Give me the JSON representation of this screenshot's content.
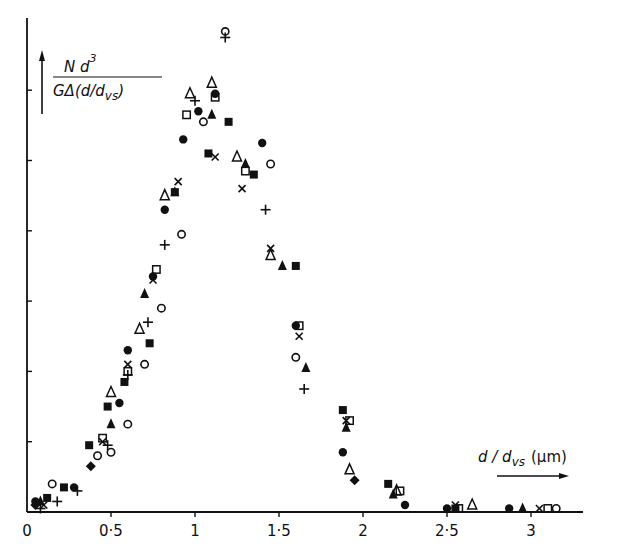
{
  "chart_data": {
    "type": "scatter",
    "title": "",
    "xlabel": "d/d_vs (μm)",
    "ylabel": "N d^3 / G Δ(d/d_vs)",
    "ylabel_parts": {
      "numerator": "N d",
      "numerator_sup": "3",
      "denominator": "GΔ(d/d",
      "denominator_sub": "vs",
      "denominator_end": ")"
    },
    "xlabel_parts": {
      "main": "d / d",
      "sub": "vs",
      "unit": "(μm)"
    },
    "xlim": [
      0,
      3.3
    ],
    "ylim": [
      0,
      7
    ],
    "x_ticks": [
      {
        "value": 0,
        "label": "0"
      },
      {
        "value": 0.5,
        "label": "0·5"
      },
      {
        "value": 1,
        "label": "1"
      },
      {
        "value": 1.5,
        "label": "1·5"
      },
      {
        "value": 2,
        "label": "2"
      },
      {
        "value": 2.5,
        "label": "2·5"
      },
      {
        "value": 3,
        "label": "3"
      }
    ],
    "y_ticks": [
      1,
      2,
      3,
      4,
      5,
      6
    ],
    "y_tick_labels_shown": false,
    "grid": false,
    "legend": null,
    "markers": [
      "filled-circle",
      "open-circle",
      "filled-triangle",
      "open-triangle",
      "filled-square",
      "open-square",
      "cross",
      "plus",
      "filled-diamond"
    ],
    "series": [
      {
        "name": "filled-circle",
        "marker": "filled-circle",
        "points": [
          [
            0.05,
            0.15
          ],
          [
            0.28,
            0.35
          ],
          [
            0.55,
            1.55
          ],
          [
            0.6,
            2.3
          ],
          [
            0.75,
            3.35
          ],
          [
            0.82,
            4.3
          ],
          [
            0.93,
            5.3
          ],
          [
            1.12,
            5.95
          ],
          [
            1.02,
            5.7
          ],
          [
            1.4,
            5.25
          ],
          [
            1.6,
            2.65
          ],
          [
            1.88,
            0.85
          ],
          [
            2.25,
            0.1
          ],
          [
            2.5,
            0.05
          ],
          [
            2.87,
            0.05
          ]
        ]
      },
      {
        "name": "open-circle",
        "marker": "open-circle",
        "points": [
          [
            0.15,
            0.4
          ],
          [
            0.42,
            0.8
          ],
          [
            0.5,
            0.85
          ],
          [
            0.6,
            1.25
          ],
          [
            0.7,
            2.1
          ],
          [
            0.8,
            2.9
          ],
          [
            0.92,
            3.95
          ],
          [
            1.05,
            5.55
          ],
          [
            1.45,
            4.95
          ],
          [
            1.6,
            2.2
          ],
          [
            3.15,
            0.05
          ]
        ]
      },
      {
        "name": "filled-triangle",
        "marker": "filled-triangle",
        "points": [
          [
            0.08,
            0.15
          ],
          [
            0.5,
            1.25
          ],
          [
            0.7,
            3.1
          ],
          [
            0.88,
            4.55
          ],
          [
            1.1,
            5.65
          ],
          [
            1.3,
            4.95
          ],
          [
            1.52,
            3.5
          ],
          [
            1.66,
            2.05
          ],
          [
            1.9,
            1.2
          ],
          [
            2.18,
            0.25
          ],
          [
            2.95,
            0.05
          ]
        ]
      },
      {
        "name": "open-triangle",
        "marker": "open-triangle",
        "points": [
          [
            0.5,
            1.7
          ],
          [
            0.67,
            2.6
          ],
          [
            0.82,
            4.5
          ],
          [
            0.97,
            5.95
          ],
          [
            1.1,
            6.1
          ],
          [
            1.25,
            5.05
          ],
          [
            1.45,
            3.65
          ],
          [
            1.92,
            0.6
          ],
          [
            2.2,
            0.3
          ],
          [
            2.65,
            0.1
          ]
        ]
      },
      {
        "name": "filled-square",
        "marker": "filled-square",
        "points": [
          [
            0.12,
            0.2
          ],
          [
            0.22,
            0.35
          ],
          [
            0.37,
            0.95
          ],
          [
            0.48,
            1.5
          ],
          [
            0.58,
            1.85
          ],
          [
            0.73,
            2.4
          ],
          [
            0.88,
            4.55
          ],
          [
            1.08,
            5.1
          ],
          [
            1.2,
            5.55
          ],
          [
            1.35,
            4.8
          ],
          [
            1.6,
            3.5
          ],
          [
            1.88,
            1.45
          ],
          [
            2.15,
            0.4
          ],
          [
            2.55,
            0.05
          ]
        ]
      },
      {
        "name": "open-square",
        "marker": "open-square",
        "points": [
          [
            0.45,
            1.05
          ],
          [
            0.6,
            2.0
          ],
          [
            0.77,
            3.45
          ],
          [
            0.95,
            5.65
          ],
          [
            1.12,
            5.9
          ],
          [
            1.3,
            4.85
          ],
          [
            1.62,
            2.65
          ],
          [
            1.92,
            1.3
          ],
          [
            2.22,
            0.3
          ],
          [
            2.57,
            0.05
          ],
          [
            3.1,
            0.05
          ]
        ]
      },
      {
        "name": "cross",
        "marker": "cross",
        "points": [
          [
            0.1,
            0.1
          ],
          [
            0.45,
            1.0
          ],
          [
            0.6,
            2.1
          ],
          [
            0.75,
            3.3
          ],
          [
            0.9,
            4.7
          ],
          [
            1.12,
            5.05
          ],
          [
            1.28,
            4.6
          ],
          [
            1.45,
            3.75
          ],
          [
            1.62,
            2.5
          ],
          [
            1.9,
            1.3
          ],
          [
            2.55,
            0.1
          ],
          [
            3.05,
            0.05
          ]
        ]
      },
      {
        "name": "plus",
        "marker": "plus",
        "points": [
          [
            0.08,
            0.05
          ],
          [
            0.18,
            0.15
          ],
          [
            0.3,
            0.3
          ],
          [
            0.48,
            0.95
          ],
          [
            0.6,
            1.95
          ],
          [
            0.72,
            2.7
          ],
          [
            0.82,
            3.8
          ],
          [
            1.0,
            5.85
          ],
          [
            1.18,
            6.75
          ],
          [
            1.42,
            4.3
          ],
          [
            1.65,
            1.75
          ]
        ]
      },
      {
        "name": "filled-diamond",
        "marker": "filled-diamond",
        "points": [
          [
            0.05,
            0.1
          ],
          [
            0.38,
            0.65
          ],
          [
            1.95,
            0.45
          ]
        ]
      }
    ]
  }
}
